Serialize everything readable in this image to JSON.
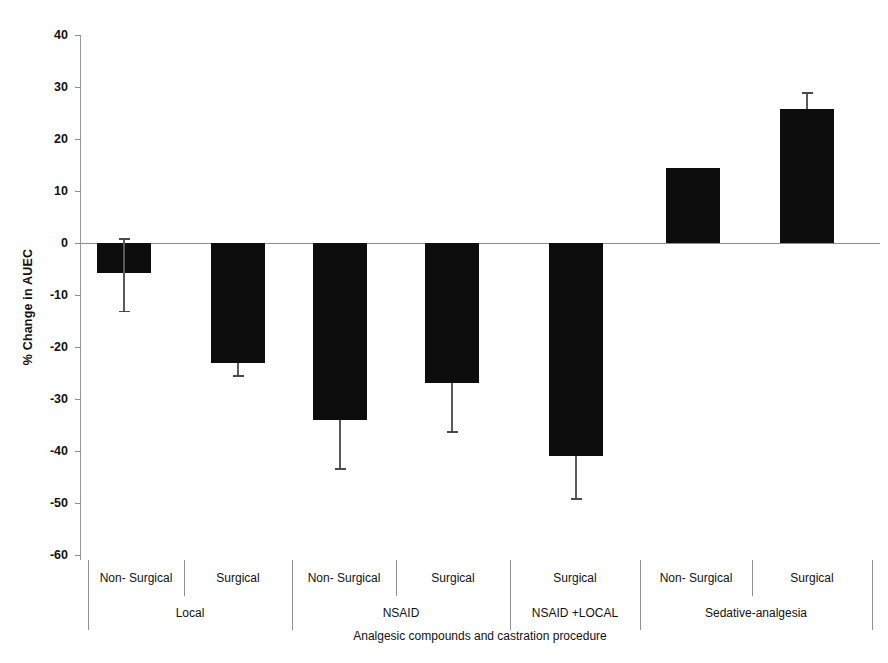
{
  "chart_data": {
    "type": "bar",
    "title": "",
    "subtitle": "",
    "xlabel": "Analgesic compounds and castration procedure",
    "ylabel": "% Change in AUEC",
    "ylim": [
      -60,
      40
    ],
    "ytick_labels": [
      "40",
      "30",
      "20",
      "10",
      "0",
      "-10",
      "-20",
      "-30",
      "-40",
      "-50",
      "-60"
    ],
    "ytick_values": [
      40,
      30,
      20,
      10,
      0,
      -10,
      -20,
      -30,
      -40,
      -50,
      -60
    ],
    "grid": false,
    "legend": "none",
    "orientation": "vertical",
    "bar_color": "#0d0d0d",
    "error_color": "#4a4a4a",
    "categories": [
      "Non- Surgical",
      "Surgical",
      "Non- Surgical",
      "Surgical",
      "Surgical",
      "Non- Surgical",
      "Surgical"
    ],
    "values": [
      -5.8,
      -23.0,
      -34.0,
      -27.0,
      -41.0,
      14.5,
      25.7
    ],
    "errors_upper": [
      6.8,
      0.0,
      0.0,
      0.0,
      0.0,
      0.0,
      3.3
    ],
    "errors_lower": [
      7.2,
      2.4,
      9.3,
      9.2,
      8.0,
      0.0,
      3.3
    ],
    "groups": [
      {
        "label": "Local",
        "span": 2
      },
      {
        "label": "NSAID",
        "span": 2
      },
      {
        "label": "NSAID +LOCAL",
        "span": 1
      },
      {
        "label": "Sedative-analgesia",
        "span": 2
      }
    ],
    "series": [
      {
        "name": "% Change in AUEC",
        "values": [
          -5.8,
          -23.0,
          -34.0,
          -27.0,
          -41.0,
          14.5,
          25.7
        ]
      }
    ]
  },
  "axes": {
    "y_title": "% Change in AUEC",
    "x_title": "Analgesic compounds and castration procedure"
  }
}
